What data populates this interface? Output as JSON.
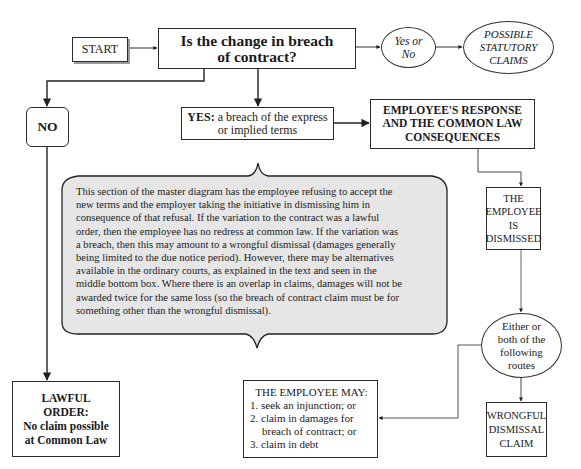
{
  "diagram": {
    "start": "START",
    "question": [
      "Is the change in breach",
      "of contract?"
    ],
    "yes_or_no": [
      "Yes or",
      "No"
    ],
    "statutory_claims": [
      "POSSIBLE",
      "STATUTORY",
      "CLAIMS"
    ],
    "no_label": "NO",
    "yes": {
      "prefix": "YES:",
      "text_line1": " a breach of the express",
      "text_line2": "or implied terms"
    },
    "employee_response": [
      "EMPLOYEE'S RESPONSE",
      "AND THE COMMON LAW",
      "CONSEQUENCES"
    ],
    "explanation": [
      "This section of the master diagram has the employee refusing to accept the",
      "new terms and the employer taking the initiative in dismissing him in",
      "consequence of that refusal. If the variation to the contract was a lawful",
      "order, then the employee has no redress at common law. If the variation was",
      "a breach, then this may amount to a wrongful dismissal (damages generally",
      "being limited to the due notice period). However, there may be alternatives",
      "available in the ordinary courts, as explained in the text and seen in the",
      "middle bottom box. Where there is an overlap in claims, damages will not be",
      "awarded twice for the same loss (so the breach of contract claim must be for",
      "something other than the wrongful dismissal)."
    ],
    "employee_dismissed": [
      "THE",
      "EMPLOYEE",
      "IS",
      "DISMISSED"
    ],
    "routes": [
      "Either or",
      "both of the",
      "following",
      "routes"
    ],
    "lawful_order": [
      "LAWFUL",
      "ORDER:",
      "No claim possible",
      "at Common Law"
    ],
    "employee_may": {
      "title": "THE EMPLOYEE MAY:",
      "items": [
        "1. seek an injunction; or",
        "2. claim in damages for breach of contract; or",
        "3. claim in debt"
      ]
    },
    "wrongful_dismissal": [
      "WRONGFUL",
      "DISMISSAL",
      "CLAIM"
    ]
  }
}
